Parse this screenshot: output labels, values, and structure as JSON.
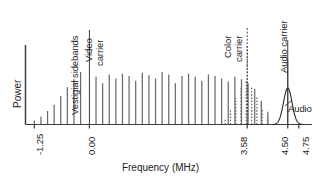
{
  "chart_data": {
    "type": "bar",
    "title": "",
    "xlabel": "Frequency (MHz)",
    "ylabel": "Power",
    "xlim": [
      -1.45,
      5.05
    ],
    "ylim": [
      0,
      1
    ],
    "grid": false,
    "legend": null,
    "xticks": [
      -1.25,
      0.0,
      3.58,
      4.5,
      4.75
    ],
    "xtick_labels": [
      "-1.25",
      "0.00",
      "3.58",
      "4.50",
      "4.75"
    ],
    "axis_color": "#3d3d3d",
    "luma_line_color": "#6b6b6b",
    "chroma_line_color": "#6b6b6b",
    "carrier_color": "#3d3d3d",
    "audio_curve_color": "#2b2b2b",
    "series": [
      {
        "name": "Video carrier",
        "style": "solid",
        "x": [
          0.0
        ],
        "values": [
          0.93
        ]
      },
      {
        "name": "Luminance sidebands",
        "style": "solid",
        "x": [
          -1.25,
          -1.1,
          -0.95,
          -0.8,
          -0.65,
          -0.5,
          -0.35,
          -0.2,
          0.15,
          0.3,
          0.45,
          0.6,
          0.75,
          0.9,
          1.05,
          1.2,
          1.35,
          1.5,
          1.65,
          1.8,
          1.95,
          2.1,
          2.25,
          2.4,
          2.55,
          2.7,
          2.85,
          3.0,
          3.15,
          3.3,
          3.45,
          3.6,
          3.75,
          3.9,
          4.05
        ],
        "values": [
          0.05,
          0.1,
          0.17,
          0.25,
          0.36,
          0.47,
          0.57,
          0.66,
          0.6,
          0.52,
          0.63,
          0.58,
          0.64,
          0.61,
          0.55,
          0.65,
          0.62,
          0.58,
          0.66,
          0.63,
          0.52,
          0.61,
          0.64,
          0.6,
          0.55,
          0.63,
          0.61,
          0.58,
          0.54,
          0.6,
          0.57,
          0.52,
          0.45,
          0.3,
          0.16
        ]
      },
      {
        "name": "Chrominance sidebands",
        "style": "dashed",
        "x": [
          3.08,
          3.2,
          3.32,
          3.44,
          3.56,
          3.68,
          3.8,
          3.92,
          4.04
        ],
        "values": [
          0.07,
          0.18,
          0.33,
          0.46,
          0.55,
          0.48,
          0.34,
          0.2,
          0.09
        ]
      },
      {
        "name": "Color carrier",
        "style": "dashed",
        "x": [
          3.58
        ],
        "values": [
          1.0
        ]
      },
      {
        "name": "Audio carrier",
        "style": "solid",
        "x": [
          4.5
        ],
        "values": [
          0.82
        ]
      },
      {
        "name": "Audio",
        "style": "curve",
        "center": 4.5,
        "width": 0.22,
        "peak": 0.46,
        "x_start": 4.16,
        "x_end": 4.86
      }
    ],
    "annotations": [
      {
        "name": "vestigial-sidebands",
        "text": "Vestigial sidebands",
        "rotation": -90,
        "leader": false
      },
      {
        "name": "video-carrier",
        "text_lines": [
          "Video",
          "carrier"
        ],
        "rotation": -90,
        "leader": true,
        "leader_style": "solid",
        "x": 0.0
      },
      {
        "name": "color-carrier",
        "text_lines": [
          "Color",
          "carrier"
        ],
        "rotation": -90,
        "leader": true,
        "leader_style": "dashed",
        "x": 3.58
      },
      {
        "name": "audio-carrier",
        "text_lines": [
          "Audio carrier"
        ],
        "rotation": -90,
        "leader": true,
        "leader_style": "solid",
        "x": 4.5
      },
      {
        "name": "audio",
        "text_lines": [
          "Audio"
        ],
        "rotation": 0,
        "leader": true,
        "leader_style": "solid"
      }
    ]
  },
  "labels": {
    "ylabel": "Power",
    "xlabel": "Frequency (MHz)",
    "tick_m125": "-1.25",
    "tick_000": "0.00",
    "tick_358": "3.58",
    "tick_450": "4.50",
    "tick_475": "4.75",
    "ann_vestigial": "Vestigial sidebands",
    "ann_video_1": "Video",
    "ann_video_2": "carrier",
    "ann_color_1": "Color",
    "ann_color_2": "carrier",
    "ann_audio_carrier": "Audio carrier",
    "ann_audio": "Audio"
  }
}
